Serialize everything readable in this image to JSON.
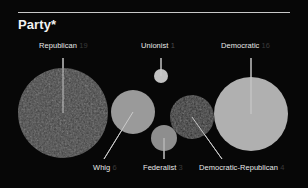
{
  "header": {
    "title": "Party*"
  },
  "chart_data": {
    "type": "bubble",
    "title": "Party*",
    "xlabel": "",
    "ylabel": "",
    "legend": "none",
    "grid": false,
    "categories": [
      "Republican",
      "Unionist",
      "Democratic",
      "Whig",
      "Federalist",
      "Democratic-Republican"
    ],
    "values": [
      19,
      1,
      16,
      6,
      3,
      4
    ],
    "points": [
      {
        "label": "Republican",
        "value": 19,
        "cx": 63,
        "cy": 113,
        "r": 45,
        "color": "#3d3d3d",
        "textured": true,
        "leader": {
          "x1": 63,
          "y1": 58,
          "x2": 63,
          "y2": 113
        }
      },
      {
        "label": "Unionist",
        "value": 1,
        "cx": 161,
        "cy": 76,
        "r": 7,
        "color": "#c2c2c2",
        "textured": false,
        "leader": {
          "x1": 161,
          "y1": 58,
          "x2": 161,
          "y2": 76
        }
      },
      {
        "label": "Democratic",
        "value": 16,
        "cx": 251,
        "cy": 114,
        "r": 37,
        "color": "#b0b0b0",
        "textured": false,
        "leader": {
          "x1": 251,
          "y1": 58,
          "x2": 251,
          "y2": 114
        }
      },
      {
        "label": "Whig",
        "value": 6,
        "cx": 133,
        "cy": 112,
        "r": 22,
        "color": "#9a9a9a",
        "textured": false,
        "leader": {
          "x1": 133,
          "y1": 112,
          "x2": 104,
          "y2": 159
        }
      },
      {
        "label": "Federalist",
        "value": 3,
        "cx": 164,
        "cy": 138,
        "r": 13,
        "color": "#8e8e8e",
        "textured": false,
        "leader": {
          "x1": 164,
          "y1": 138,
          "x2": 164,
          "y2": 159
        }
      },
      {
        "label": "Democratic-Republican",
        "value": 4,
        "cx": 192,
        "cy": 117,
        "r": 22,
        "color": "#2b2b2b",
        "textured": true,
        "leader": {
          "x1": 192,
          "y1": 117,
          "x2": 222,
          "y2": 159
        }
      }
    ],
    "labels": [
      {
        "name": "Republican",
        "value": "19",
        "x": 39,
        "y": 41,
        "anchor": "start",
        "dim": true
      },
      {
        "name": "Unionist",
        "value": "1",
        "x": 141,
        "y": 41,
        "anchor": "start",
        "dim": false
      },
      {
        "name": "Democratic",
        "value": "16",
        "x": 221,
        "y": 41,
        "anchor": "start",
        "dim": true
      },
      {
        "name": "Whig",
        "value": "6",
        "x": 93,
        "y": 163,
        "anchor": "start",
        "dim": true
      },
      {
        "name": "Federalist",
        "value": "3",
        "x": 143,
        "y": 163,
        "anchor": "start",
        "dim": true
      },
      {
        "name": "Democratic-Republican",
        "value": "4",
        "x": 199,
        "y": 163,
        "anchor": "start",
        "dim": true
      }
    ]
  },
  "colors": {
    "background": "#070707",
    "title_text": "#f2f2f2",
    "label_text": "#e8e8e8",
    "value_text": "#4a4a4a",
    "leader_line": "#d0d0d0",
    "divider": "#c8c8c8"
  }
}
